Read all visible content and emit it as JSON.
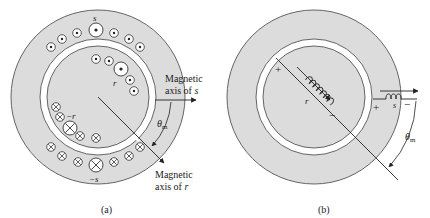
{
  "figure_a": {
    "caption": "(a)",
    "stator_label": "s",
    "stator_neg_label": "−s",
    "rotor_label": "r",
    "rotor_neg_label": "−r",
    "axis_s_line1": "Magnetic",
    "axis_s_line2": "axis of ",
    "axis_s_var": "s",
    "axis_r_line1": "Magnetic",
    "axis_r_line2": "axis of ",
    "axis_r_var": "r",
    "theta": "θ",
    "theta_sub": "m"
  },
  "figure_b": {
    "caption": "(b)",
    "rotor_coil_label": "r",
    "stator_coil_label": "s",
    "rotor_plus": "+",
    "rotor_minus": "−",
    "stator_plus": "+",
    "stator_minus": "−",
    "theta": "θ",
    "theta_sub": "m"
  },
  "colors": {
    "iron": "#dcdcdc",
    "gap": "#ffffff",
    "stroke": "#333333"
  }
}
